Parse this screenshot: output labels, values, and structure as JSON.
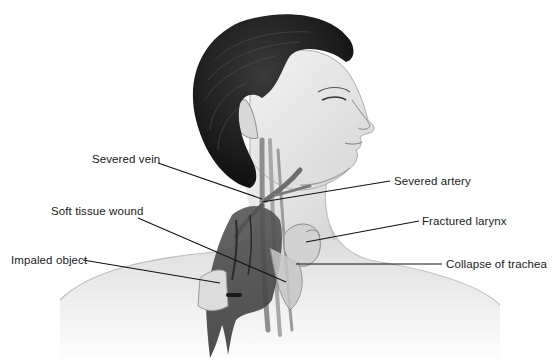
{
  "figure": {
    "labels": [
      {
        "id": "severed-vein",
        "text": "Severed vein",
        "side": "left"
      },
      {
        "id": "soft-tissue-wound",
        "text": "Soft tissue wound",
        "side": "left"
      },
      {
        "id": "impaled-object",
        "text": "Impaled object",
        "side": "left"
      },
      {
        "id": "severed-artery",
        "text": "Severed artery",
        "side": "right"
      },
      {
        "id": "fractured-larynx",
        "text": "Fractured larynx",
        "side": "right"
      },
      {
        "id": "collapse-of-trachea",
        "text": "Collapse of trachea",
        "side": "right"
      }
    ],
    "colors": {
      "background": "#ffffff",
      "label_text": "#1a1a1a",
      "leader_line": "#111111",
      "hair": "#141414",
      "skin_light": "#eeeeee",
      "skin_shadow": "#b5b5b5",
      "blood": "#4a4a4a"
    }
  }
}
